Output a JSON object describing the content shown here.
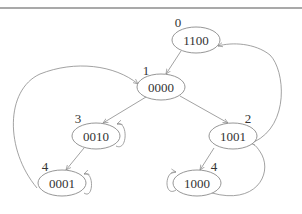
{
  "diagram": {
    "type": "state-transition-graph",
    "nodes": [
      {
        "id": "n1100",
        "state": "1100",
        "label": "0",
        "cx": 196,
        "cy": 40
      },
      {
        "id": "n0000",
        "state": "0000",
        "label": "1",
        "cx": 161,
        "cy": 87
      },
      {
        "id": "n0010",
        "state": "0010",
        "label": "3",
        "cx": 96,
        "cy": 136
      },
      {
        "id": "n1001",
        "state": "1001",
        "label": "2",
        "cx": 233,
        "cy": 136
      },
      {
        "id": "n0001",
        "state": "0001",
        "label": "4",
        "cx": 62,
        "cy": 183
      },
      {
        "id": "n1000",
        "state": "1000",
        "label": "4",
        "cx": 197,
        "cy": 183
      }
    ],
    "edges": [
      {
        "from": "1100",
        "to": "0000"
      },
      {
        "from": "0000",
        "to": "0010"
      },
      {
        "from": "0000",
        "to": "1001"
      },
      {
        "from": "0010",
        "to": "0001"
      },
      {
        "from": "1001",
        "to": "1000"
      },
      {
        "from": "0001",
        "to": "0000"
      },
      {
        "from": "1001",
        "to": "1100"
      },
      {
        "from": "1000",
        "to": "1001"
      },
      {
        "from": "0010",
        "to": "0010"
      },
      {
        "from": "0001",
        "to": "0001"
      },
      {
        "from": "1000",
        "to": "1000"
      }
    ]
  }
}
